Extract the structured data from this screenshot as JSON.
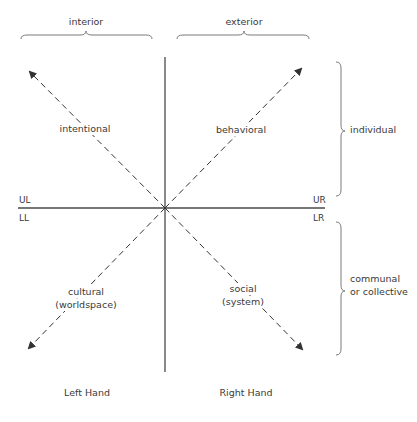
{
  "diagram": {
    "type": "four-quadrant",
    "top_groups": [
      {
        "label": "interior"
      },
      {
        "label": "exterior"
      }
    ],
    "side_groups": [
      {
        "label": "individual"
      },
      {
        "label_line1": "communal",
        "label_line2": "or collective"
      }
    ],
    "quadrants": {
      "UL": {
        "code": "UL",
        "label": "intentional"
      },
      "UR": {
        "code": "UR",
        "label": "behavioral"
      },
      "LL": {
        "code": "LL",
        "label_line1": "cultural",
        "label_line2": "(worldspace)"
      },
      "LR": {
        "code": "LR",
        "label_line1": "social",
        "label_line2": "(system)"
      }
    },
    "bottom_labels": {
      "left": "Left Hand",
      "right": "Right Hand"
    },
    "colors": {
      "axis": "#4a4a4a",
      "arrow": "#333333",
      "brace": "#7a7a7a",
      "text": "#3a3a3a"
    }
  }
}
